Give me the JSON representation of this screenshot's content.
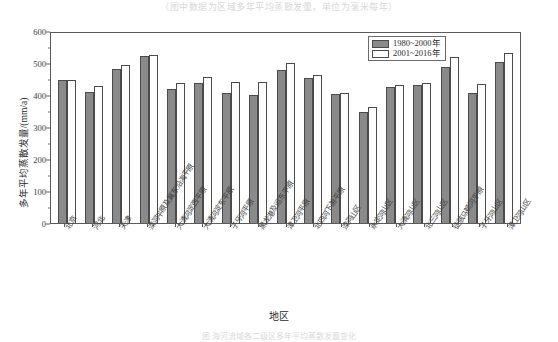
{
  "top_strip": {
    "text": "（图中数据为区域多年平均蒸散发量，单位为毫米每年）"
  },
  "caption": {
    "text": "图    海河流域各二级区多年平均蒸散发量变化"
  },
  "legend": {
    "position": "top-right",
    "entries": [
      {
        "label": "1980~2000年",
        "color": "#8a8a8a",
        "swatch": "s0"
      },
      {
        "label": "2001~2016年",
        "color": "#fdfdfd",
        "swatch": "s1"
      }
    ]
  },
  "axes": {
    "y_label": "多年平均蒸散发量/(mm/a)",
    "x_label": "地区",
    "y_ticks": [
      "0",
      "100",
      "200",
      "300",
      "400",
      "500",
      "600"
    ]
  },
  "chart_data": {
    "type": "bar",
    "title": "",
    "subtitle": "",
    "xlabel": "地区",
    "ylabel": "多年平均蒸散发量/(mm/a)",
    "ylim": [
      0,
      600
    ],
    "ytick_interval": 100,
    "yminor_interval": 50,
    "grid": false,
    "legend_position": "top-right",
    "orientation": "vertical",
    "categories": [
      "北京",
      "河北",
      "天津",
      "滦河平原及冀东沿海平原",
      "大清河淀西平原",
      "大清河淀东平原",
      "子牙河平原",
      "黑龙港及运东平原",
      "漳卫河平原",
      "北四河下游平原",
      "滦河山区",
      "永定河山区",
      "大清河山区",
      "北三河山区",
      "徒骇马颊河平原",
      "子牙河山区",
      "漳卫河山区"
    ],
    "series": [
      {
        "name": "1980~2000年",
        "color": "#8a8a8a",
        "values": [
          447,
          410,
          482,
          523,
          419,
          436,
          405,
          399,
          478,
          452,
          403,
          348,
          425,
          432,
          486,
          405,
          502
        ]
      },
      {
        "name": "2001~2016年",
        "color": "#fdfdfd",
        "values": [
          447,
          427,
          495,
          525,
          437,
          456,
          440,
          440,
          500,
          463,
          407,
          364,
          430,
          438,
          520,
          435,
          530
        ]
      }
    ]
  }
}
